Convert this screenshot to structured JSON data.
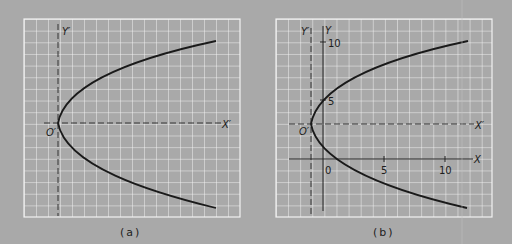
{
  "figure": {
    "background_color": "#a9a9a9",
    "grid_color": "#f2f2f2",
    "curve_color": "#1a1a1a",
    "panels": [
      {
        "id": "a",
        "caption": "(a)",
        "labels": {
          "y_prime": "Y′",
          "x_prime": "X′",
          "origin_prime": "O′"
        },
        "equation": "(y′)² = 4x′",
        "grid": {
          "columns": 18,
          "rows": 17
        }
      },
      {
        "id": "b",
        "caption": "(b)",
        "labels": {
          "y_prime": "Y′",
          "x_prime": "X′",
          "origin_prime": "O′",
          "y_axis": "Y",
          "x_axis": "X"
        },
        "x_ticks": [
          "0",
          "5",
          "10"
        ],
        "y_ticks": [
          "5",
          "10"
        ],
        "vertex": [
          -1,
          3
        ],
        "equation": "(y − 3)² = 4(x + 1)",
        "grid": {
          "columns": 18,
          "rows": 17
        }
      }
    ]
  }
}
